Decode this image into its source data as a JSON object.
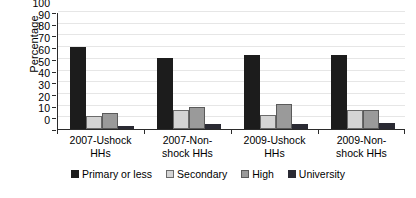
{
  "chart_data": {
    "type": "bar",
    "title": "",
    "xlabel": "",
    "ylabel": "Percentage",
    "ylim": [
      0,
      100
    ],
    "yticks": [
      0,
      10,
      20,
      30,
      40,
      50,
      60,
      70,
      80,
      90,
      100
    ],
    "ytick_labels": [
      "0",
      "10",
      "20",
      "30",
      "40",
      "50",
      "60",
      "70",
      "80",
      "90",
      "100"
    ],
    "grid": true,
    "legend_position": "bottom",
    "categories": [
      "2007-Ushock HHs",
      "2007-Non-shock HHs",
      "2009-Ushock HHs",
      "2009-Non-shock HHs"
    ],
    "category_lines": [
      [
        "2007-Ushock",
        "HHs"
      ],
      [
        "2007-Non-",
        "shock HHs"
      ],
      [
        "2009-Ushock",
        "HHs"
      ],
      [
        "2009-Non-",
        "shock HHs"
      ]
    ],
    "series": [
      {
        "name": "Primary or less",
        "color": "#1c1c1c",
        "values": [
          70,
          61,
          63,
          63
        ]
      },
      {
        "name": "Secondary",
        "color": "#d4d4d4",
        "values": [
          11,
          16,
          12,
          16
        ]
      },
      {
        "name": "High",
        "color": "#9a9a9a",
        "values": [
          14,
          19,
          21,
          16
        ]
      },
      {
        "name": "University",
        "color": "#2a2a33",
        "values": [
          3,
          4,
          4,
          5
        ]
      }
    ]
  }
}
